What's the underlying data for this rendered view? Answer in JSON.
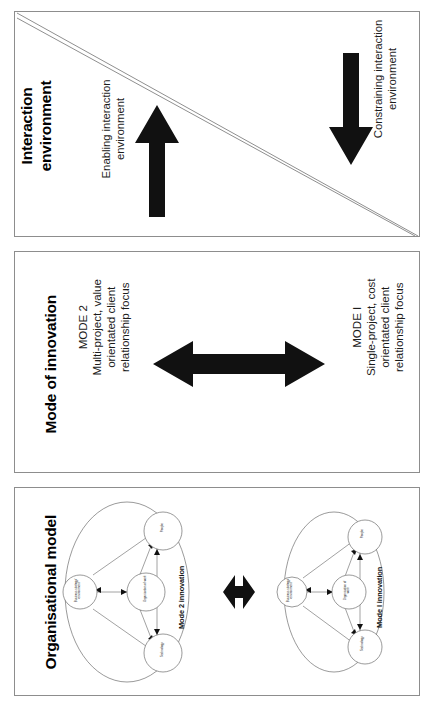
{
  "figure": {
    "orientation": "rotated-90",
    "panels": [
      {
        "id": "interaction-environment",
        "title": "Interaction environment",
        "title_lines": [
          "Interaction",
          "environment"
        ],
        "left_label": "Enabling interaction environment",
        "left_label_lines": [
          "Enabling interaction",
          "environment"
        ],
        "right_label": "Constraining interaction environment",
        "right_label_lines": [
          "Constraining interaction",
          "environment"
        ],
        "left_arrow": "up-arrow",
        "right_arrow": "down-arrow",
        "divider": "diagonal-double-line"
      },
      {
        "id": "mode-of-innovation",
        "title": "Mode of innovation",
        "left_heading": "MODE 2",
        "left_lines": [
          "Multi-project, value",
          "orientated client",
          "relationship focus"
        ],
        "right_heading": "MODE I",
        "right_lines": [
          "Single-project, cost",
          "orientated client",
          "relationship focus"
        ],
        "arrow": "double-headed-arrow"
      },
      {
        "id": "organisational-model",
        "title": "Organisational model",
        "arrow": "small-double-headed-arrow",
        "diagrams": [
          {
            "caption": "Mode 2 innovation",
            "nodes": [
              "Business strategy/ environment",
              "Organisation of work",
              "People",
              "Technology"
            ]
          },
          {
            "caption": "Mode I innovation",
            "nodes": [
              "Business strategy/ environment",
              "Organisation of work",
              "People",
              "Technology"
            ]
          }
        ]
      }
    ]
  },
  "colors": {
    "ink": "#111111",
    "panel_border": "#8d8d8d",
    "diagram_stroke": "#555555",
    "background": "#ffffff"
  }
}
